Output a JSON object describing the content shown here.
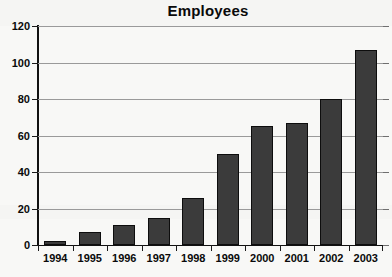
{
  "chart_data": {
    "type": "bar",
    "title": "Employees",
    "xlabel": "",
    "ylabel": "",
    "categories": [
      "1994",
      "1995",
      "1996",
      "1997",
      "1998",
      "1999",
      "2000",
      "2001",
      "2002",
      "2003"
    ],
    "values": [
      2,
      7,
      11,
      15,
      26,
      50,
      65,
      67,
      80,
      107
    ],
    "ylim": [
      0,
      120
    ],
    "ytick_labels": [
      "0",
      "20",
      "40",
      "60",
      "80",
      "100",
      "120"
    ],
    "ytick_values": [
      0,
      20,
      40,
      60,
      80,
      100,
      120
    ],
    "grid": true,
    "legend": false,
    "legend_position": "none",
    "bar_color": "#3b3b3b",
    "bar_edge_color": "#0d0d0d",
    "gridline_color": "#9a9a9a",
    "axis_color": "#111111",
    "text_color": "#0a0a0a",
    "background_color": "#f8f8f6"
  }
}
